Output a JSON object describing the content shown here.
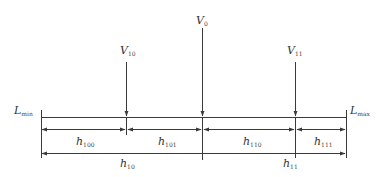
{
  "diagram": {
    "type": "dimension-split-diagram",
    "colors": {
      "line": "#3a3a3a",
      "text": "#333333",
      "background": "#ffffff"
    },
    "vertical_markers": [
      {
        "id": "V0",
        "base": "V",
        "sub": "0",
        "x": 202,
        "y_top": 28
      },
      {
        "id": "V10",
        "base": "V",
        "sub": "10",
        "x": 126,
        "y_top": 62
      },
      {
        "id": "V11",
        "base": "V",
        "sub": "11",
        "x": 295,
        "y_top": 62
      }
    ],
    "bounds": {
      "min": {
        "base": "L",
        "sub": "min"
      },
      "max": {
        "base": "L",
        "sub": "max"
      }
    },
    "segments_level2": [
      {
        "base": "h",
        "sub": "100",
        "from": "Lmin",
        "to": "V10"
      },
      {
        "base": "h",
        "sub": "101",
        "from": "V10",
        "to": "V0"
      },
      {
        "base": "h",
        "sub": "110",
        "from": "V0",
        "to": "V11"
      },
      {
        "base": "h",
        "sub": "111",
        "from": "V11",
        "to": "Lmax"
      }
    ],
    "segments_level1": [
      {
        "base": "h",
        "sub": "10",
        "from": "Lmin",
        "to": "V0"
      },
      {
        "base": "h",
        "sub": "11",
        "from": "V0",
        "to": "Lmax"
      }
    ]
  }
}
